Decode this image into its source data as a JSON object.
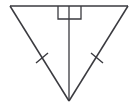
{
  "figure": {
    "kind": "geometry-diagram",
    "canvas": {
      "width": 137,
      "height": 106,
      "background": "#ffffff"
    },
    "stroke_color": "#3a3a3f",
    "stroke_width": 1.5,
    "vertices": {
      "top_left": {
        "name": "top-left-vertex",
        "x": 10,
        "y": 6
      },
      "top_right": {
        "name": "top-right-vertex",
        "x": 128,
        "y": 6
      },
      "bottom_apex": {
        "name": "bottom-apex-vertex",
        "x": 69,
        "y": 101
      },
      "top_midpoint": {
        "name": "top-midpoint",
        "x": 69,
        "y": 6
      }
    },
    "segments": [
      {
        "name": "top-side",
        "from": "top_left",
        "to": "top_right",
        "path": "M 10 6 L 128 6"
      },
      {
        "name": "left-leg",
        "from": "top_left",
        "to": "bottom_apex",
        "path": "M 10 6 L 69 101"
      },
      {
        "name": "right-leg",
        "from": "top_right",
        "to": "bottom_apex",
        "path": "M 128 6 L 69 101"
      },
      {
        "name": "altitude-line",
        "from": "top_midpoint",
        "to": "bottom_apex",
        "path": "M 69 6 L 69 101"
      }
    ],
    "right_angle_marker": {
      "name": "right-angle-square",
      "at_vertex": "top_midpoint",
      "path": "M 58 6 L 58 19 L 81 19 L 81 6",
      "note": "square marker hanging below the top side, bisected by the altitude"
    },
    "tick_marks": [
      {
        "name": "left-leg-congruence-tick",
        "on_segment": "left-leg",
        "center_x": 42,
        "center_y": 58,
        "path": "M 36 63 L 48 53"
      },
      {
        "name": "right-leg-congruence-tick",
        "on_segment": "right-leg",
        "center_x": 97,
        "center_y": 58,
        "path": "M 91 53 L 103 63"
      }
    ],
    "labels": {
      "alt_text": "Inverted triangle with vertical altitude, right angle mark at top, and congruent side tick marks"
    }
  }
}
